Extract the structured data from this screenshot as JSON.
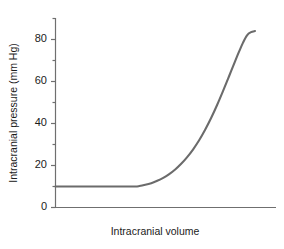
{
  "chart_data": {
    "type": "line",
    "title": "",
    "xlabel": "Intracranial volume",
    "ylabel": "Intracranial pressure (mm Hg)",
    "ylim": [
      0,
      90
    ],
    "xlim": [
      0,
      100
    ],
    "grid": false,
    "legend": null,
    "y_major_ticks": [
      0,
      20,
      40,
      60,
      80
    ],
    "y_major_tick_labels": [
      "0",
      "20",
      "40",
      "60",
      "80"
    ],
    "y_minor_ticks": [
      10,
      30,
      50,
      70,
      90
    ],
    "x_ticks": [],
    "x_tick_labels": [],
    "series": [
      {
        "name": "Pressure-volume curve",
        "color": "#6b6b6b",
        "x": [
          0,
          5,
          10,
          15,
          20,
          25,
          30,
          35,
          40,
          42,
          45,
          48,
          51,
          54,
          57,
          60,
          63,
          66,
          69,
          72,
          75,
          78,
          81,
          84,
          87,
          90,
          92,
          94,
          96,
          98,
          100
        ],
        "y": [
          10,
          10,
          10,
          10,
          10,
          10,
          10,
          10,
          10,
          10.2,
          10.8,
          11.6,
          12.7,
          14.1,
          15.9,
          18.1,
          20.8,
          24.0,
          27.7,
          32.0,
          37.0,
          42.6,
          48.8,
          55.5,
          62.5,
          69.6,
          74.2,
          78.5,
          82.0,
          83.5,
          84.0
        ]
      }
    ]
  },
  "axis_labels": {
    "y_title": "Intracranial pressure (mm Hg)",
    "x_title": "Intracranial volume",
    "y_tick_0": "0",
    "y_tick_20": "20",
    "y_tick_40": "40",
    "y_tick_60": "60",
    "y_tick_80": "80"
  },
  "colors": {
    "curve": "#6b6b6b",
    "axis": "#6f6f6f",
    "text": "#1b1b1b",
    "background": "#ffffff"
  }
}
